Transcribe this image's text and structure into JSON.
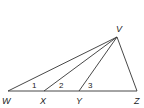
{
  "diagram": {
    "points": {
      "V": {
        "label": "V",
        "x": 117,
        "y": 37,
        "lx": 116,
        "ly": 32
      },
      "W": {
        "label": "W",
        "x": 8,
        "y": 91,
        "lx": 2,
        "ly": 104
      },
      "X": {
        "label": "X",
        "x": 44,
        "y": 91,
        "lx": 40,
        "ly": 104
      },
      "Y": {
        "label": "Y",
        "x": 79,
        "y": 91,
        "lx": 76,
        "ly": 104
      },
      "Z": {
        "label": "Z",
        "x": 137,
        "y": 91,
        "lx": 134,
        "ly": 104
      }
    },
    "angles": [
      {
        "label": "1",
        "x": 32,
        "y": 88
      },
      {
        "label": "2",
        "x": 59,
        "y": 88
      },
      {
        "label": "3",
        "x": 88,
        "y": 88
      }
    ],
    "segments": [
      [
        "W",
        "Z"
      ],
      [
        "V",
        "W"
      ],
      [
        "V",
        "X"
      ],
      [
        "V",
        "Y"
      ],
      [
        "V",
        "Z"
      ]
    ],
    "stroke_color": "#333333"
  }
}
